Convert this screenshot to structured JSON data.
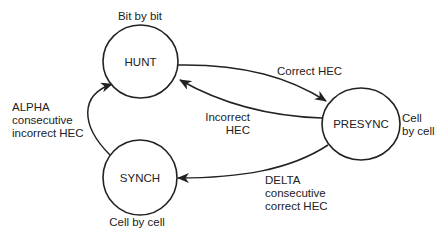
{
  "colors": {
    "ink": "#222222",
    "background": "#ffffff"
  },
  "states": {
    "hunt": {
      "label": "HUNT",
      "note": "Bit by bit"
    },
    "presync": {
      "label": "PRESYNC",
      "note_line1": "Cell",
      "note_line2": "by cell"
    },
    "synch": {
      "label": "SYNCH",
      "note": "Cell by cell"
    }
  },
  "transitions": {
    "hunt_to_presync": {
      "label": "Correct HEC"
    },
    "presync_to_hunt": {
      "label_line1": "Incorrect",
      "label_line2": "HEC"
    },
    "presync_to_synch": {
      "label_line1": "DELTA",
      "label_line2": "consecutive",
      "label_line3": "correct HEC"
    },
    "synch_to_hunt": {
      "label_line1": "ALPHA",
      "label_line2": "consecutive",
      "label_line3": "incorrect HEC"
    }
  }
}
